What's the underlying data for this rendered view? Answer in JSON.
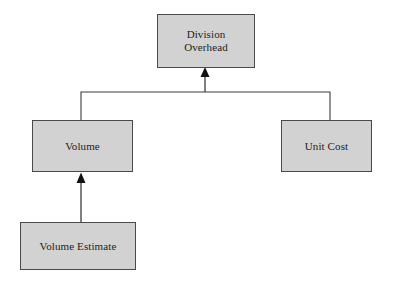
{
  "diagram": {
    "type": "hierarchy-tree",
    "background_color": "#ffffff",
    "node_fill_color": "#d2d2d2",
    "node_border_color": "#4a4a4a",
    "connector_color": "#3c3c3c",
    "text_color": "#1d1d1d",
    "nodes": [
      {
        "id": "division-overhead",
        "label": "Division\nOverhead",
        "level": 0
      },
      {
        "id": "volume",
        "label": "Volume",
        "level": 1
      },
      {
        "id": "unit-cost",
        "label": "Unit Cost",
        "level": 1
      },
      {
        "id": "volume-estimate",
        "label": "Volume Estimate",
        "level": 2
      }
    ],
    "edges": [
      {
        "id": "volume-to-division-overhead",
        "from": "volume",
        "to": "division-overhead",
        "arrowhead": "solid-triangle"
      },
      {
        "id": "unit-cost-to-division-overhead",
        "from": "unit-cost",
        "to": "division-overhead",
        "arrowhead": "solid-triangle"
      },
      {
        "id": "volume-estimate-to-volume",
        "from": "volume-estimate",
        "to": "volume",
        "arrowhead": "solid-triangle"
      }
    ]
  }
}
